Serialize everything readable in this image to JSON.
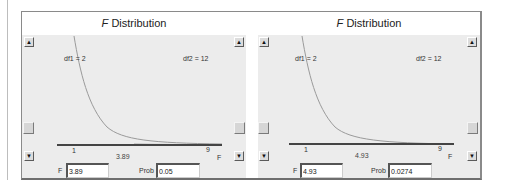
{
  "panels": [
    {
      "title_italic": "F",
      "title_rest": " Distribution",
      "df1_label": "df1 = 2",
      "df2_label": "df2 = 12",
      "axis_min_label": "1",
      "axis_max_label": "9",
      "axis_var_label": "F",
      "value_label": "3.89",
      "f_label": "F",
      "f_value": "3.89",
      "prob_label": "Prob",
      "prob_value": "0.05",
      "icons": {
        "up": "▲",
        "down": "▼"
      }
    },
    {
      "title_italic": "F",
      "title_rest": " Distribution",
      "df1_label": "df1 = 2",
      "df2_label": "df2 = 12",
      "axis_min_label": "1",
      "axis_max_label": "9",
      "axis_var_label": "F",
      "value_label": "4.93",
      "f_label": "F",
      "f_value": "4.93",
      "prob_label": "Prob",
      "prob_value": "0.0274",
      "icons": {
        "up": "▲",
        "down": "▼"
      }
    }
  ],
  "colors": {
    "plot_bg": "#ececec",
    "curve": "#9a9a9a",
    "shade": "#c8c8c8",
    "axis": "#444444"
  }
}
